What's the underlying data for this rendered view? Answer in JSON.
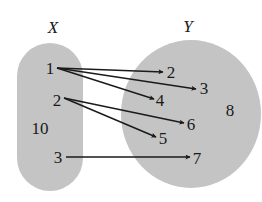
{
  "diagram": {
    "type": "mapping-diagram",
    "colors": {
      "set_fill": "#c4c4c4",
      "ink": "#1a1a1a",
      "background": "#ffffff"
    },
    "sets": [
      {
        "id": "X",
        "label": "X",
        "label_pos": [
          53,
          33
        ],
        "shape": "rounded-rect",
        "bounds": [
          17,
          43,
          66,
          148
        ]
      },
      {
        "id": "Y",
        "label": "Y",
        "label_pos": [
          188,
          32
        ],
        "shape": "ellipse",
        "center": [
          191,
          114
        ],
        "radii": [
          70,
          74
        ]
      }
    ],
    "nodes": [
      {
        "id": "x1",
        "set": "X",
        "label": "1",
        "pos": [
          50,
          74
        ]
      },
      {
        "id": "x2",
        "set": "X",
        "label": "2",
        "pos": [
          57,
          106
        ]
      },
      {
        "id": "x10",
        "set": "X",
        "label": "10",
        "pos": [
          40,
          134
        ]
      },
      {
        "id": "x3",
        "set": "X",
        "label": "3",
        "pos": [
          58,
          163
        ]
      },
      {
        "id": "y2",
        "set": "Y",
        "label": "2",
        "pos": [
          171,
          78
        ]
      },
      {
        "id": "y3",
        "set": "Y",
        "label": "3",
        "pos": [
          204,
          94
        ]
      },
      {
        "id": "y4",
        "set": "Y",
        "label": "4",
        "pos": [
          160,
          106
        ]
      },
      {
        "id": "y6",
        "set": "Y",
        "label": "6",
        "pos": [
          191,
          130
        ]
      },
      {
        "id": "y5",
        "set": "Y",
        "label": "5",
        "pos": [
          163,
          144
        ]
      },
      {
        "id": "y7",
        "set": "Y",
        "label": "7",
        "pos": [
          197,
          164
        ]
      },
      {
        "id": "y8",
        "set": "Y",
        "label": "8",
        "pos": [
          230,
          116
        ]
      }
    ],
    "edges": [
      {
        "from": "1",
        "to": "2",
        "x1": 57,
        "y1": 68,
        "x2": 163,
        "y2": 72
      },
      {
        "from": "1",
        "to": "3",
        "x1": 57,
        "y1": 68,
        "x2": 196,
        "y2": 89
      },
      {
        "from": "1",
        "to": "4",
        "x1": 57,
        "y1": 68,
        "x2": 154,
        "y2": 99
      },
      {
        "from": "2",
        "to": "6",
        "x1": 64,
        "y1": 98,
        "x2": 184,
        "y2": 123
      },
      {
        "from": "2",
        "to": "5",
        "x1": 64,
        "y1": 98,
        "x2": 156,
        "y2": 137
      },
      {
        "from": "3",
        "to": "7",
        "x1": 66,
        "y1": 157,
        "x2": 190,
        "y2": 157
      }
    ]
  }
}
